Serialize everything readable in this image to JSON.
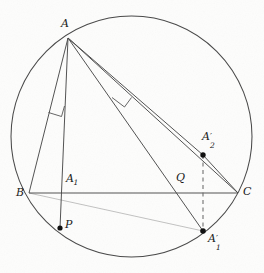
{
  "figure": {
    "type": "euclidean-geometry-diagram",
    "background_color": "#fdfdfc",
    "stroke_color": "#3a3a3a",
    "label_color": "#1a1a1a",
    "canvas": {
      "width": 264,
      "height": 273
    },
    "circle": {
      "name": "circumcircle",
      "cx": 131.5,
      "cy": 136.5,
      "r": 120.5
    },
    "points": [
      {
        "id": "A",
        "label": "A",
        "x": 68,
        "y": 38,
        "label_x": 61,
        "label_y": 21,
        "dot": false
      },
      {
        "id": "B",
        "label": "B",
        "x": 29,
        "y": 193,
        "label_x": 18,
        "label_y": 192,
        "dot": false
      },
      {
        "id": "C",
        "label": "C",
        "x": 238,
        "y": 193,
        "label_x": 243,
        "label_y": 188,
        "dot": false
      },
      {
        "id": "A1",
        "label": "A",
        "sub": "1",
        "x": 67,
        "y": 193,
        "label_x": 68,
        "label_y": 172,
        "dot": false
      },
      {
        "id": "P",
        "label": "P",
        "x": 60,
        "y": 228,
        "label_x": 66,
        "label_y": 222,
        "dot": true
      },
      {
        "id": "Q",
        "label": "Q",
        "x": 183,
        "y": 193,
        "label_x": 177,
        "label_y": 173,
        "dot": false
      },
      {
        "id": "A1p",
        "label": "A",
        "sub": "1",
        "prime": true,
        "x": 203,
        "y": 231,
        "label_x": 209,
        "label_y": 235,
        "dot": true
      },
      {
        "id": "A2p",
        "label": "A",
        "sub": "2",
        "prime": true,
        "x": 203,
        "y": 155,
        "label_x": 203,
        "label_y": 130,
        "dot": true
      }
    ],
    "segments": [
      {
        "name": "side-BC",
        "from": "B",
        "to": "C",
        "style": "solid"
      },
      {
        "name": "side-AB",
        "from": "A",
        "to": "B",
        "style": "solid"
      },
      {
        "name": "side-AC",
        "from": "A",
        "to": "C",
        "style": "solid"
      },
      {
        "name": "altitude-A-to-P",
        "from": "A",
        "to": "P",
        "style": "solid"
      },
      {
        "name": "cevian-A-to-A1p",
        "from": "A",
        "to": "A1p",
        "style": "solid"
      },
      {
        "name": "cevian-A-to-A2p",
        "from": "A",
        "to": "A2p",
        "style": "solid"
      },
      {
        "name": "chord-A2p-to-C",
        "from": "A2p",
        "to": "C",
        "style": "solid"
      },
      {
        "name": "chord-B-to-A1p",
        "from": "B",
        "to": "A1p",
        "style": "solid"
      },
      {
        "name": "dashed-A2p-to-A1p",
        "from": "A2p",
        "to": "A1p",
        "style": "dashed"
      }
    ],
    "right_angle_marks": [
      {
        "name": "right-angle-mark-near-AB",
        "x": 49,
        "y": 113,
        "size": 12
      },
      {
        "name": "right-angle-mark-on-cevian",
        "x": 114,
        "y": 94,
        "size": 13
      }
    ]
  }
}
